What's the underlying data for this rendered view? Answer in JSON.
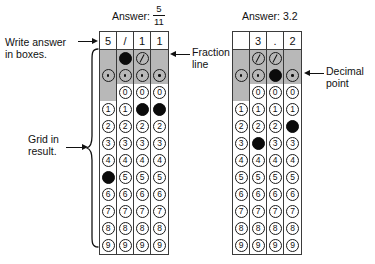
{
  "grids": [
    {
      "id": "grid-fraction",
      "caption_label": "Answer:",
      "caption_value_type": "fraction",
      "caption_numerator": "5",
      "caption_denominator": "11",
      "answer_text": "5/11",
      "header_boxes": [
        "5",
        "/",
        "1",
        "1"
      ],
      "special_rows": [
        {
          "name": "fraction-line-row",
          "symbol": "/",
          "marks": [
            false,
            true,
            false,
            false
          ],
          "present": [
            false,
            true,
            true,
            false
          ]
        },
        {
          "name": "decimal-point-row",
          "symbol": ".",
          "marks": [
            false,
            false,
            false,
            false
          ],
          "present": [
            true,
            true,
            true,
            true
          ]
        }
      ],
      "digit_rows": [
        {
          "digit": "0",
          "marks": [
            false,
            false,
            false,
            false
          ],
          "present": [
            false,
            true,
            true,
            true
          ]
        },
        {
          "digit": "1",
          "marks": [
            false,
            false,
            true,
            true
          ],
          "present": [
            true,
            true,
            true,
            true
          ]
        },
        {
          "digit": "2",
          "marks": [
            false,
            false,
            false,
            false
          ],
          "present": [
            true,
            true,
            true,
            true
          ]
        },
        {
          "digit": "3",
          "marks": [
            false,
            false,
            false,
            false
          ],
          "present": [
            true,
            true,
            true,
            true
          ]
        },
        {
          "digit": "4",
          "marks": [
            false,
            false,
            false,
            false
          ],
          "present": [
            true,
            true,
            true,
            true
          ]
        },
        {
          "digit": "5",
          "marks": [
            true,
            false,
            false,
            false
          ],
          "present": [
            true,
            true,
            true,
            true
          ]
        },
        {
          "digit": "6",
          "marks": [
            false,
            false,
            false,
            false
          ],
          "present": [
            true,
            true,
            true,
            true
          ]
        },
        {
          "digit": "7",
          "marks": [
            false,
            false,
            false,
            false
          ],
          "present": [
            true,
            true,
            true,
            true
          ]
        },
        {
          "digit": "8",
          "marks": [
            false,
            false,
            false,
            false
          ],
          "present": [
            true,
            true,
            true,
            true
          ]
        },
        {
          "digit": "9",
          "marks": [
            false,
            false,
            false,
            false
          ],
          "present": [
            true,
            true,
            true,
            true
          ]
        }
      ]
    },
    {
      "id": "grid-decimal",
      "caption_label": "Answer:",
      "caption_value_type": "plain",
      "caption_value": "3.2",
      "answer_text": "3.2",
      "header_boxes": [
        "",
        "3",
        ".",
        "2"
      ],
      "special_rows": [
        {
          "name": "fraction-line-row",
          "symbol": "/",
          "marks": [
            false,
            false,
            false,
            false
          ],
          "present": [
            false,
            true,
            true,
            false
          ]
        },
        {
          "name": "decimal-point-row",
          "symbol": ".",
          "marks": [
            false,
            false,
            true,
            false
          ],
          "present": [
            true,
            true,
            true,
            true
          ]
        }
      ],
      "digit_rows": [
        {
          "digit": "0",
          "marks": [
            false,
            false,
            false,
            false
          ],
          "present": [
            false,
            true,
            true,
            true
          ]
        },
        {
          "digit": "1",
          "marks": [
            false,
            false,
            false,
            false
          ],
          "present": [
            true,
            true,
            true,
            true
          ]
        },
        {
          "digit": "2",
          "marks": [
            false,
            false,
            false,
            true
          ],
          "present": [
            true,
            true,
            true,
            true
          ]
        },
        {
          "digit": "3",
          "marks": [
            false,
            true,
            false,
            false
          ],
          "present": [
            true,
            true,
            true,
            true
          ]
        },
        {
          "digit": "4",
          "marks": [
            false,
            false,
            false,
            false
          ],
          "present": [
            true,
            true,
            true,
            true
          ]
        },
        {
          "digit": "5",
          "marks": [
            false,
            false,
            false,
            false
          ],
          "present": [
            true,
            true,
            true,
            true
          ]
        },
        {
          "digit": "6",
          "marks": [
            false,
            false,
            false,
            false
          ],
          "present": [
            true,
            true,
            true,
            true
          ]
        },
        {
          "digit": "7",
          "marks": [
            false,
            false,
            false,
            false
          ],
          "present": [
            true,
            true,
            true,
            true
          ]
        },
        {
          "digit": "8",
          "marks": [
            false,
            false,
            false,
            false
          ],
          "present": [
            true,
            true,
            true,
            true
          ]
        },
        {
          "digit": "9",
          "marks": [
            false,
            false,
            false,
            false
          ],
          "present": [
            true,
            true,
            true,
            true
          ]
        }
      ]
    }
  ],
  "annotations": {
    "write_answer": "Write answer\nin boxes.",
    "grid_in_result": "Grid in\nresult.",
    "fraction_line": "Fraction\nline",
    "decimal_point": "Decimal\npoint"
  },
  "colors": {
    "shade": "#b8b8b8",
    "ink": "#111111",
    "rule": "#3b3b3b",
    "paper": "#ffffff"
  }
}
